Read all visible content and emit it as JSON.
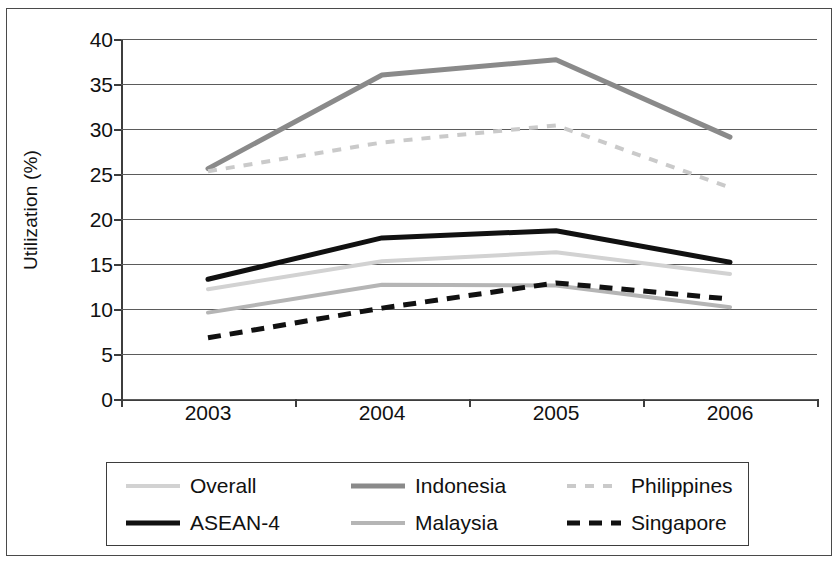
{
  "chart_data": {
    "type": "line",
    "title": "",
    "xlabel": "",
    "ylabel": "Utilization (%)",
    "categories": [
      "2003",
      "2004",
      "2005",
      "2006"
    ],
    "ylim": [
      0,
      40
    ],
    "yticks": [
      0,
      5,
      10,
      15,
      20,
      25,
      30,
      35,
      40
    ],
    "ytick_labels": [
      "0",
      "5",
      "10",
      "15",
      "20",
      "25",
      "30",
      "35",
      "40"
    ],
    "grid": true,
    "legend_position": "bottom",
    "series": [
      {
        "name": "Overall",
        "values": [
          12.2,
          15.3,
          16.3,
          13.9
        ],
        "color": "#d2d2d2",
        "style": "solid",
        "width": 4
      },
      {
        "name": "ASEAN-4",
        "values": [
          13.3,
          17.9,
          18.7,
          15.2
        ],
        "color": "#111111",
        "style": "solid",
        "width": 5
      },
      {
        "name": "Indonesia",
        "values": [
          25.6,
          36.0,
          37.7,
          29.1
        ],
        "color": "#8a8a8a",
        "style": "solid",
        "width": 5
      },
      {
        "name": "Malaysia",
        "values": [
          9.6,
          12.7,
          12.6,
          10.2
        ],
        "color": "#b5b5b5",
        "style": "solid",
        "width": 4
      },
      {
        "name": "Philippines",
        "values": [
          25.3,
          28.5,
          30.4,
          23.5
        ],
        "color": "#cacaca",
        "style": "dashed",
        "width": 4
      },
      {
        "name": "Singapore",
        "values": [
          6.8,
          10.1,
          12.9,
          11.1
        ],
        "color": "#111111",
        "style": "dashed",
        "width": 5
      }
    ]
  },
  "axis": {
    "y_title": "Utilization (%)",
    "y_tick_labels": [
      "40",
      "35",
      "30",
      "25",
      "20",
      "15",
      "10",
      "5",
      "0"
    ],
    "x_tick_labels": [
      "2003",
      "2004",
      "2005",
      "2006"
    ]
  },
  "legend": {
    "entries": [
      {
        "label": "Overall",
        "swatch": "line-swatch-overall"
      },
      {
        "label": "Indonesia",
        "swatch": "line-swatch-indonesia"
      },
      {
        "label": "Philippines",
        "swatch": "line-swatch-philippines"
      },
      {
        "label": "ASEAN-4",
        "swatch": "line-swatch-asean4"
      },
      {
        "label": "Malaysia",
        "swatch": "line-swatch-malaysia"
      },
      {
        "label": "Singapore",
        "swatch": "line-swatch-singapore"
      }
    ]
  }
}
